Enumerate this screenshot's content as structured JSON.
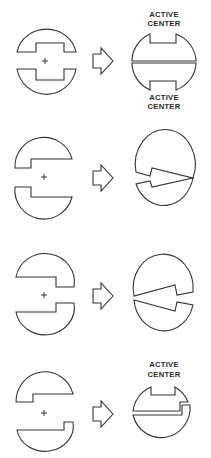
{
  "diagram": {
    "rows": [
      {
        "id": 1,
        "left_shape": "two halves with rectangular notches, separated, center marked +",
        "right_shape": "circle split horizontally with notches top and bottom",
        "labels": [
          "ACTIVE",
          "CENTER",
          "ACTIVE",
          "CENTER"
        ],
        "label_top": {
          "line1": "ACTIVE",
          "line2": "CENTER"
        },
        "label_bottom": {
          "line1": "ACTIVE",
          "line2": "CENTER"
        }
      },
      {
        "id": 2,
        "left_shape": "two halves with left-side steps, separated, center marked +",
        "right_shape": "circle with wedge-shaped arrow pointing right"
      },
      {
        "id": 3,
        "left_shape": "two halves with right-side steps, separated, center marked +",
        "right_shape": "circle with wedge opening pointing left"
      },
      {
        "id": 4,
        "left_shape": "two halves with offset steps, separated, center marked +",
        "right_shape": "circle with stepped split and top notch",
        "label_top": {
          "line1": "ACTIVE",
          "line2": "CENTER"
        }
      }
    ],
    "arrow_icon": "hollow-right-arrow",
    "center_marker": "+",
    "colors": {
      "stroke": "#333333",
      "background": "#ffffff"
    }
  }
}
